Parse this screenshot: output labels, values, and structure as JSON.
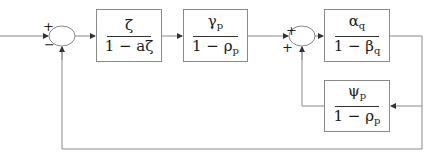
{
  "diagram": {
    "type": "block-diagram",
    "blocks": {
      "b1": {
        "num": "ζ",
        "den": "1 − aζ"
      },
      "b2": {
        "num": "γ",
        "num_sub": "p",
        "den": "1 − ρ",
        "den_sub": "p"
      },
      "b3": {
        "num": "α",
        "num_sub": "q",
        "den": "1 − β",
        "den_sub": "q"
      },
      "fb": {
        "num": "ψ",
        "num_sub": "p",
        "den": "1 − ρ",
        "den_sub": "p"
      }
    },
    "summers": {
      "s1": {
        "sign_top": "+",
        "sign_bottom": "−"
      },
      "s2": {
        "sign_top": "+",
        "sign_bottom": "+"
      }
    },
    "line_color": "#8a8a8a"
  }
}
